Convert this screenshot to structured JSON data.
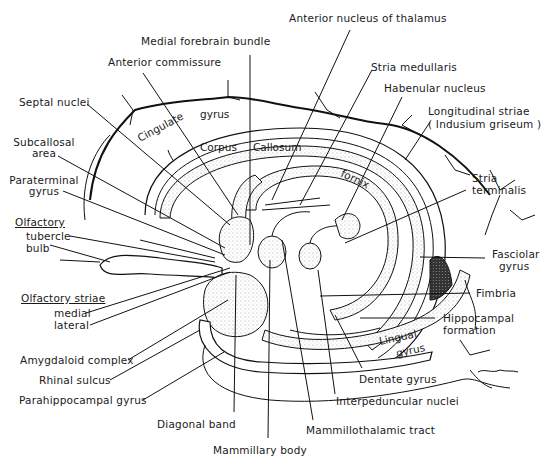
{
  "figure": {
    "type": "anatomical line drawing",
    "signature": "Chalmers"
  },
  "labels": {
    "anterior_nucleus_thalamus": "Anterior nucleus of thalamus",
    "medial_forebrain_bundle": "Medial forebrain bundle",
    "anterior_commissure": "Anterior commissure",
    "stria_medullaris": "Stria medullaris",
    "habenular_nucleus": "Habenular nucleus",
    "septal_nuclei": "Septal nuclei",
    "longitudinal_striae": "Longitudinal striae",
    "indusium_griseum": "( Indusium griseum )",
    "subcallosal_area_1": "Subcallosal",
    "subcallosal_area_2": "area",
    "paraterminal_gyrus_1": "Paraterminal",
    "paraterminal_gyrus_2": "gyrus",
    "stria_terminalis_1": "Stria",
    "stria_terminalis_2": "terminalis",
    "olfactory": "Olfactory",
    "tubercle": "tubercle",
    "bulb": "bulb",
    "fasciolar_gyrus_1": "Fasciolar",
    "fasciolar_gyrus_2": "gyrus",
    "olfactory_striae": "Olfactory striae",
    "medial": "medial",
    "lateral": "lateral",
    "fimbria": "Fimbria",
    "hippocampal_formation_1": "Hippocampal",
    "hippocampal_formation_2": "formation",
    "amygdaloid_complex": "Amygdaloid complex",
    "rhinal_sulcus": "Rhinal sulcus",
    "parahippocampal_gyrus": "Parahippocampal gyrus",
    "dentate_gyrus": "Dentate gyrus",
    "interpeduncular_nuclei": "Interpeduncular nuclei",
    "diagonal_band": "Diagonal band",
    "mammillothalamic_tract": "Mammillothalamic tract",
    "mammillary_body": "Mammillary body"
  },
  "inner_labels": {
    "cingulate": "Cingulate",
    "gyrus": "gyrus",
    "corpus": "Corpus",
    "callosum": "Callosum",
    "fornix": "fornix",
    "lingual": "Lingual",
    "lingual_gyrus": "gyrus"
  }
}
